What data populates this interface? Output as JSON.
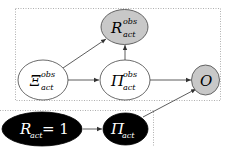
{
  "diagram": {
    "type": "graphical-model",
    "groups": [
      {
        "id": "observed-group",
        "style": "dotted"
      },
      {
        "id": "actual-group",
        "style": "dotted"
      }
    ],
    "nodes": [
      {
        "id": "R_obs",
        "base": "R",
        "sup": "obs",
        "sub": "act",
        "fill": "#c8c8c8",
        "text_color": "#000000"
      },
      {
        "id": "Xi_obs",
        "base": "Ξ",
        "sup": "obs",
        "sub": "act",
        "fill": "#ffffff",
        "text_color": "#000000"
      },
      {
        "id": "Pi_obs",
        "base": "Π",
        "sup": "obs",
        "sub": "act",
        "fill": "#ffffff",
        "text_color": "#000000"
      },
      {
        "id": "O",
        "base": "O",
        "sup": "",
        "sub": "",
        "fill": "#c8c8c8",
        "text_color": "#000000"
      },
      {
        "id": "R_act",
        "base": "R",
        "sup": "",
        "sub": "act",
        "suffix": " = 1",
        "fill": "#000000",
        "text_color": "#ffffff"
      },
      {
        "id": "Pi_act",
        "base": "Π",
        "sup": "",
        "sub": "act",
        "fill": "#000000",
        "text_color": "#ffffff"
      }
    ],
    "edges": [
      {
        "from": "Xi_obs",
        "to": "R_obs"
      },
      {
        "from": "Xi_obs",
        "to": "Pi_obs"
      },
      {
        "from": "Pi_obs",
        "to": "R_obs"
      },
      {
        "from": "Pi_obs",
        "to": "O"
      },
      {
        "from": "R_act",
        "to": "Pi_act"
      },
      {
        "from": "Pi_act",
        "to": "O"
      }
    ]
  },
  "labels": {
    "r_obs_base": "R",
    "r_obs_sup": "obs",
    "r_obs_sub": "act",
    "xi_obs_base": "Ξ",
    "xi_obs_sup": "obs",
    "xi_obs_sub": "act",
    "pi_obs_base": "Π",
    "pi_obs_sup": "obs",
    "pi_obs_sub": "act",
    "o_base": "O",
    "r_act_base": "R",
    "r_act_sub": "act",
    "r_act_suffix": " = 1",
    "pi_act_base": "Π",
    "pi_act_sub": "act"
  },
  "colors": {
    "observed_fill": "#c8c8c8",
    "latent_fill": "#ffffff",
    "intervention_fill": "#000000",
    "edge": "#333333",
    "group_border": "#9a9a9a"
  }
}
